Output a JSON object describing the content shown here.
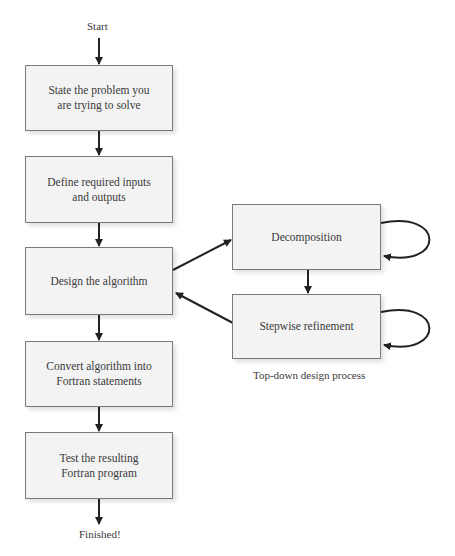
{
  "diagram": {
    "start_label": "Start",
    "end_label": "Finished!",
    "main_steps": [
      {
        "lines": [
          "State the problem you",
          "are trying to solve"
        ]
      },
      {
        "lines": [
          "Define required inputs",
          "and outputs"
        ]
      },
      {
        "lines": [
          "Design the algorithm"
        ]
      },
      {
        "lines": [
          "Convert algorithm into",
          "Fortran statements"
        ]
      },
      {
        "lines": [
          "Test the resulting",
          "Fortran program"
        ]
      }
    ],
    "subprocess": {
      "steps": [
        {
          "label": "Decomposition"
        },
        {
          "label": "Stepwise refinement"
        }
      ],
      "caption": "Top-down design process"
    },
    "colors": {
      "box_fill": "#f3f3f3",
      "box_border": "#7a7a7a",
      "arrow": "#222222",
      "text": "#3a3a3a"
    }
  }
}
